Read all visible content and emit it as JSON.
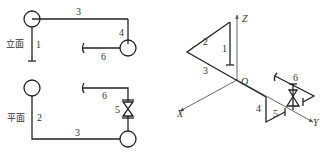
{
  "elevation_view": {
    "title": "立面",
    "pipe_labels": {
      "p1": "1",
      "p3": "3",
      "p4": "4",
      "p6": "6"
    }
  },
  "plan_view": {
    "title": "平面",
    "pipe_labels": {
      "p2": "2",
      "p3": "3",
      "p5": "5",
      "p6": "6"
    }
  },
  "isometric_view": {
    "axes": {
      "x": "X",
      "y": "Y",
      "z": "Z",
      "origin": "O"
    },
    "pipe_labels": {
      "p1": "1",
      "p2": "2",
      "p3": "3",
      "p4": "4",
      "p5": "5",
      "p6": "6"
    }
  },
  "colors": {
    "line": "#222222",
    "axis": "#555555"
  }
}
